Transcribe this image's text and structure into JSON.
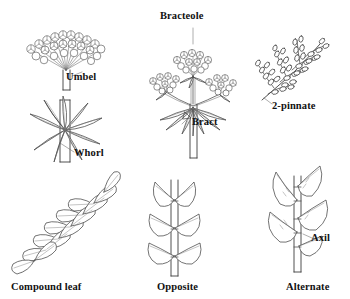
{
  "figure": {
    "background_color": "#ffffff",
    "ink_color": "#444444",
    "label_color": "#111111"
  },
  "labels": {
    "umbel": "Umbel",
    "whorl": "Whorl",
    "compound_leaf": "Compound leaf",
    "bracteole": "Bracteole",
    "bract": "Bract",
    "opposite": "Opposite",
    "two_pinnate": "2-pinnate",
    "axil": "Axil",
    "alternate": "Alternate"
  },
  "panels": [
    {
      "id": "umbel",
      "label": "Umbel",
      "column": "left",
      "row": "top",
      "description": "Dome-shaped flower cluster with pedicels radiating from a single point atop a stem"
    },
    {
      "id": "whorl",
      "label": "Whorl",
      "column": "left",
      "row": "middle",
      "description": "Eight narrow leaves radiating from one node around an upright stem"
    },
    {
      "id": "compound-leaf",
      "label": "Compound leaf",
      "column": "left",
      "row": "bottom",
      "description": "Leaf divided into paired leaflets along a rachis"
    },
    {
      "id": "compound-umbel",
      "label": "Bracteole / Bract",
      "column": "center",
      "row": "top",
      "description": "Compound umbel with three umbellets, bracteoles under each umbellet and an involucre of bracts at the base"
    },
    {
      "id": "opposite",
      "label": "Opposite",
      "column": "center",
      "row": "bottom",
      "description": "Leaves borne in pairs directly across from each other at each node"
    },
    {
      "id": "two-pinnate",
      "label": "2-pinnate",
      "column": "right",
      "row": "top",
      "description": "Twice-divided leaf: pinnae along a rachis, each bearing leaflets"
    },
    {
      "id": "alternate",
      "label": "Alternate",
      "column": "right",
      "row": "bottom",
      "description": "Leaves borne singly, staggered along the stem; Axil marks the stem-leaf junction"
    }
  ],
  "annotations": [
    {
      "id": "bracteole",
      "text": "Bracteole",
      "points_to": "small bracts beneath an umbellet"
    },
    {
      "id": "bract",
      "text": "Bract",
      "points_to": "involucre at base of the compound umbel"
    },
    {
      "id": "axil",
      "text": "Axil",
      "points_to": "angle between leaf stalk and stem"
    }
  ]
}
